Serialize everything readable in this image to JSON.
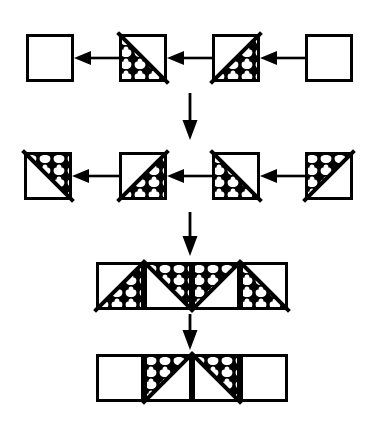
{
  "figure": {
    "background_color": "#ffffff",
    "stroke_color": "#000000",
    "fill_pattern_name": "fish-scale-hatch",
    "line_width": 3,
    "width": 377,
    "height": 428
  },
  "geometry": {
    "cell_size": 48,
    "row1_y": 34,
    "row2_y": 152,
    "row3_y": 262,
    "row4_y": 354,
    "row1_x": [
      26,
      119,
      212,
      305
    ],
    "row2_x": [
      24,
      119,
      212,
      305
    ],
    "row3_x": [
      96,
      144,
      192,
      240
    ],
    "row4_x": [
      96,
      144,
      192,
      240
    ]
  },
  "rows": [
    {
      "id": "row-1",
      "name": "top-chain",
      "direction": "right-to-left",
      "cells": [
        {
          "index": 0,
          "name": "tile-r1-c1",
          "diagonal": "none",
          "fill": "none",
          "label": "empty square"
        },
        {
          "index": 1,
          "name": "tile-r1-c2",
          "diagonal": "tl-br",
          "fill": "lower-left",
          "label": "diagonal TL-BR, lower-left hatched"
        },
        {
          "index": 2,
          "name": "tile-r1-c3",
          "diagonal": "bl-tr",
          "fill": "lower-right",
          "label": "diagonal BL-TR, lower-right hatched"
        },
        {
          "index": 3,
          "name": "tile-r1-c4",
          "diagonal": "none",
          "fill": "none",
          "label": "empty square"
        }
      ],
      "arrows": [
        {
          "name": "arrow-r1-a",
          "from_index": 1,
          "to_index": 0,
          "direction": "left"
        },
        {
          "name": "arrow-r1-b",
          "from_index": 2,
          "to_index": 1,
          "direction": "left"
        },
        {
          "name": "arrow-r1-c",
          "from_index": 3,
          "to_index": 2,
          "direction": "left"
        }
      ]
    },
    {
      "id": "row-2",
      "name": "second-chain",
      "direction": "right-to-left",
      "cells": [
        {
          "index": 0,
          "name": "tile-r2-c1",
          "diagonal": "tl-br",
          "fill": "upper-right",
          "label": "diagonal TL-BR, upper-right hatched"
        },
        {
          "index": 1,
          "name": "tile-r2-c2",
          "diagonal": "bl-tr",
          "fill": "lower-right",
          "label": "diagonal BL-TR, lower-right hatched"
        },
        {
          "index": 2,
          "name": "tile-r2-c3",
          "diagonal": "tl-br",
          "fill": "lower-left",
          "label": "diagonal TL-BR, lower-left hatched"
        },
        {
          "index": 3,
          "name": "tile-r2-c4",
          "diagonal": "bl-tr",
          "fill": "upper-left",
          "label": "diagonal BL-TR, upper-left hatched"
        }
      ],
      "arrows": [
        {
          "name": "arrow-r2-a",
          "from_index": 1,
          "to_index": 0,
          "direction": "left"
        },
        {
          "name": "arrow-r2-b",
          "from_index": 2,
          "to_index": 1,
          "direction": "left"
        },
        {
          "name": "arrow-r2-c",
          "from_index": 3,
          "to_index": 2,
          "direction": "left"
        }
      ]
    },
    {
      "id": "row-3",
      "name": "merged-strip-upper",
      "direction": "none",
      "cells": [
        {
          "index": 0,
          "name": "tile-r3-c1",
          "diagonal": "bl-tr",
          "fill": "lower-right",
          "label": "diagonal BL-TR, lower-right hatched"
        },
        {
          "index": 1,
          "name": "tile-r3-c2",
          "diagonal": "tl-br",
          "fill": "upper-right",
          "label": "diagonal TL-BR, upper-right hatched"
        },
        {
          "index": 2,
          "name": "tile-r3-c3",
          "diagonal": "bl-tr",
          "fill": "upper-left",
          "label": "diagonal BL-TR, upper-left hatched"
        },
        {
          "index": 3,
          "name": "tile-r3-c4",
          "diagonal": "tl-br",
          "fill": "lower-left",
          "label": "diagonal TL-BR, lower-left hatched"
        }
      ],
      "arrows": []
    },
    {
      "id": "row-4",
      "name": "merged-strip-lower",
      "direction": "none",
      "cells": [
        {
          "index": 0,
          "name": "tile-r4-c1",
          "diagonal": "none",
          "fill": "none",
          "label": "empty square"
        },
        {
          "index": 1,
          "name": "tile-r4-c2",
          "diagonal": "bl-tr",
          "fill": "upper-left",
          "label": "diagonal BL-TR, upper-left hatched"
        },
        {
          "index": 2,
          "name": "tile-r4-c3",
          "diagonal": "tl-br",
          "fill": "upper-right",
          "label": "diagonal TL-BR, upper-right hatched"
        },
        {
          "index": 3,
          "name": "tile-r4-c4",
          "diagonal": "none",
          "fill": "none",
          "label": "empty square"
        }
      ],
      "arrows": []
    }
  ],
  "vertical_arrows": [
    {
      "name": "arrow-down-1",
      "x": 190,
      "y_start": 93,
      "y_end": 140,
      "direction": "down"
    },
    {
      "name": "arrow-down-2",
      "x": 190,
      "y_start": 212,
      "y_end": 256,
      "direction": "down"
    },
    {
      "name": "arrow-down-3",
      "x": 190,
      "y_start": 314,
      "y_end": 350,
      "direction": "down"
    }
  ]
}
